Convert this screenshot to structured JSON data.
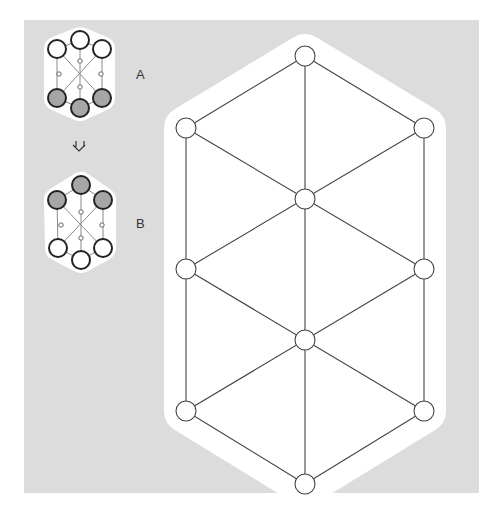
{
  "figure": {
    "background_color": "#dcdcdc",
    "halo_color": "#ffffff",
    "line_color": "#444444",
    "filled_node_color": "#a6a6a6",
    "open_node_color": "#ffffff"
  },
  "small_graphs": [
    {
      "label": "A",
      "label_pos": [
        140,
        79
      ],
      "nodes": [
        {
          "x": 80,
          "y": 40,
          "r": 9,
          "state": "open"
        },
        {
          "x": 57,
          "y": 49,
          "r": 9,
          "state": "open"
        },
        {
          "x": 102,
          "y": 49,
          "r": 9,
          "state": "open"
        },
        {
          "x": 80,
          "y": 61,
          "r": 2,
          "state": "junction"
        },
        {
          "x": 59,
          "y": 74,
          "r": 2,
          "state": "junction"
        },
        {
          "x": 101,
          "y": 74,
          "r": 2,
          "state": "junction"
        },
        {
          "x": 80,
          "y": 87,
          "r": 2,
          "state": "junction"
        },
        {
          "x": 57,
          "y": 98,
          "r": 9,
          "state": "filled"
        },
        {
          "x": 102,
          "y": 98,
          "r": 9,
          "state": "filled"
        },
        {
          "x": 80,
          "y": 108,
          "r": 9,
          "state": "filled"
        }
      ]
    },
    {
      "label": "B",
      "label_pos": [
        140,
        228
      ],
      "nodes": [
        {
          "x": 81,
          "y": 185,
          "r": 9,
          "state": "filled"
        },
        {
          "x": 57,
          "y": 200,
          "r": 9,
          "state": "filled"
        },
        {
          "x": 103,
          "y": 200,
          "r": 9,
          "state": "filled"
        },
        {
          "x": 81,
          "y": 212,
          "r": 2,
          "state": "junction"
        },
        {
          "x": 61,
          "y": 225,
          "r": 2,
          "state": "junction"
        },
        {
          "x": 102,
          "y": 225,
          "r": 2,
          "state": "junction"
        },
        {
          "x": 81,
          "y": 238,
          "r": 2,
          "state": "junction"
        },
        {
          "x": 58,
          "y": 248,
          "r": 9,
          "state": "open"
        },
        {
          "x": 103,
          "y": 248,
          "r": 9,
          "state": "open"
        },
        {
          "x": 81,
          "y": 260,
          "r": 9,
          "state": "open"
        }
      ]
    }
  ],
  "transition_arrow": {
    "symbol": "swap-down-arrows",
    "x": 80,
    "y": 145
  },
  "large_graph": {
    "nodes": [
      {
        "x": 305,
        "y": 56
      },
      {
        "x": 186,
        "y": 128
      },
      {
        "x": 424,
        "y": 128
      },
      {
        "x": 305,
        "y": 199
      },
      {
        "x": 186,
        "y": 269
      },
      {
        "x": 424,
        "y": 269
      },
      {
        "x": 305,
        "y": 340
      },
      {
        "x": 186,
        "y": 411
      },
      {
        "x": 424,
        "y": 411
      },
      {
        "x": 305,
        "y": 484
      }
    ],
    "node_radius": 10
  }
}
